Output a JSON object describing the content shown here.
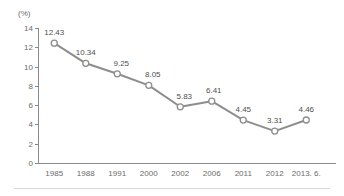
{
  "chart_data": {
    "type": "line",
    "title": "",
    "xlabel": "",
    "ylabel": "",
    "unit_label": "(%)",
    "categories": [
      "1985",
      "1988",
      "1991",
      "2000",
      "2002",
      "2006",
      "2011",
      "2012",
      "2013. 6."
    ],
    "values": [
      12.43,
      10.34,
      9.25,
      8.05,
      5.83,
      6.41,
      4.45,
      3.31,
      4.46
    ],
    "value_labels": [
      "12.43",
      "10.34",
      "9.25",
      "8.05",
      "5.83",
      "6.41",
      "4.45",
      "3.31",
      "4.46"
    ],
    "ylim": [
      0,
      14
    ],
    "yticks": [
      0,
      2,
      4,
      6,
      8,
      10,
      12,
      14
    ],
    "ytick_labels": [
      "0",
      "2",
      "4",
      "6",
      "8",
      "10",
      "12",
      "14"
    ],
    "grid": false,
    "legend": null,
    "legend_position": "none",
    "series_color": "#8d8d8d",
    "marker_fill": "#ffffff",
    "axis_color": "#8a8a8a",
    "text_color": "#6b6b6b",
    "label_color": "#4f4f4f",
    "background": "#ffffff"
  }
}
